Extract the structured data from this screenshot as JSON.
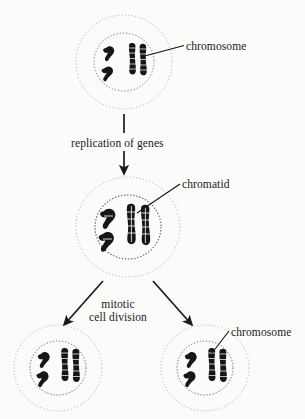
{
  "diagram": {
    "background_color": "#fbfbf9",
    "ink_color": "#1a1a1a",
    "labels": {
      "chromosome_top": "chromosome",
      "chromatid": "chromatid",
      "chromosome_bottom": "chromosome",
      "replication": "replication of genes",
      "mitotic_line1": "mitotic",
      "mitotic_line2": "cell division"
    },
    "cells": [
      {
        "id": "parent-cell",
        "stage": "before replication",
        "center": [
          124,
          62
        ],
        "outer_rx": 48,
        "outer_ry": 47,
        "nucleus_rx": 30,
        "nucleus_ry": 29,
        "chromosome_count": 4,
        "chromosome_shapes": [
          "v-shape",
          "v-shape",
          "rod",
          "rod"
        ]
      },
      {
        "id": "replicated-cell",
        "stage": "after replication of genes",
        "center": [
          128,
          227
        ],
        "outer_rx": 52,
        "outer_ry": 50,
        "nucleus_rx": 33,
        "nucleus_ry": 32,
        "chromosome_count": 4,
        "chromosome_shapes": [
          "v-shape-doubled",
          "v-shape-doubled",
          "rod-doubled",
          "rod-doubled"
        ]
      },
      {
        "id": "daughter-cell-left",
        "stage": "daughter cell",
        "center": [
          58,
          368
        ],
        "outer_rx": 44,
        "outer_ry": 43,
        "nucleus_rx": 28,
        "nucleus_ry": 27,
        "chromosome_count": 4,
        "chromosome_shapes": [
          "v-shape",
          "v-shape",
          "rod",
          "rod"
        ]
      },
      {
        "id": "daughter-cell-right",
        "stage": "daughter cell",
        "center": [
          205,
          368
        ],
        "outer_rx": 44,
        "outer_ry": 43,
        "nucleus_rx": 28,
        "nucleus_ry": 27,
        "chromosome_count": 4,
        "chromosome_shapes": [
          "v-shape",
          "v-shape",
          "rod",
          "rod"
        ]
      }
    ],
    "arrows": [
      {
        "id": "arrow-replication",
        "from": [
          124,
          114
        ],
        "to": [
          124,
          174
        ],
        "kind": "vertical-down",
        "label": "replication of genes"
      },
      {
        "id": "arrow-division-left",
        "from": [
          103,
          281
        ],
        "to": [
          64,
          325
        ],
        "kind": "diagonal-down-left",
        "label": "mitotic cell division"
      },
      {
        "id": "arrow-division-right",
        "from": [
          153,
          281
        ],
        "to": [
          193,
          325
        ],
        "kind": "diagonal-down-right",
        "label": "mitotic cell division"
      }
    ],
    "leader_lines": [
      {
        "id": "leader-chromosome-top",
        "from": [
          184,
          45
        ],
        "to": [
          141,
          57
        ]
      },
      {
        "id": "leader-chromatid",
        "from": [
          180,
          184
        ],
        "to": [
          137,
          213
        ]
      },
      {
        "id": "leader-chromosome-bottom",
        "from": [
          229,
          331
        ],
        "to": [
          211,
          353
        ]
      }
    ]
  }
}
